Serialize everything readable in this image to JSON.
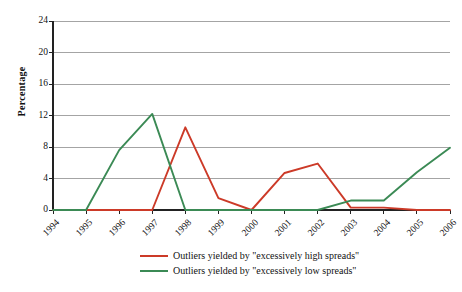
{
  "chart_data": {
    "type": "line",
    "title": "",
    "subtitle": "",
    "xlabel": "",
    "ylabel": "Percentage",
    "categories": [
      "1994",
      "1995",
      "1996",
      "1997",
      "1998",
      "1999",
      "2000",
      "2001",
      "2002",
      "2003",
      "2004",
      "2005",
      "2006"
    ],
    "x": [
      1994,
      1995,
      1996,
      1997,
      1998,
      1999,
      2000,
      2001,
      2002,
      2003,
      2004,
      2005,
      2006
    ],
    "ylim": [
      0,
      24
    ],
    "yticks": [
      0,
      4,
      8,
      12,
      16,
      20,
      24
    ],
    "ytick_labels": [
      "0",
      "4",
      "8",
      "12",
      "16",
      "20",
      "24"
    ],
    "grid": "horizontal",
    "legend_position": "bottom",
    "series": [
      {
        "name": "Outliers yielded by \"excessively high spreads\"",
        "color": "#CC3A28",
        "values": [
          0,
          0,
          0,
          0,
          10.5,
          1.5,
          0,
          4.7,
          5.9,
          0.3,
          0.3,
          0,
          0
        ]
      },
      {
        "name": "Outliers yielded by \"excessively low spreads\"",
        "color": "#3B8A55",
        "values": [
          0,
          0,
          7.6,
          12.2,
          0,
          0,
          0,
          0,
          0,
          1.2,
          1.2,
          4.8,
          7.9
        ]
      }
    ]
  },
  "axis": {
    "y_title": "Percentage",
    "y_tick_labels": [
      "0",
      "4",
      "8",
      "12",
      "16",
      "20",
      "24"
    ],
    "x_tick_labels": [
      "1994",
      "1995",
      "1996",
      "1997",
      "1998",
      "1999",
      "2000",
      "2001",
      "2002",
      "2003",
      "2004",
      "2005",
      "2006"
    ]
  },
  "legend": {
    "items": [
      {
        "label": "Outliers yielded by \"excessively high spreads\"",
        "color": "#CC3A28"
      },
      {
        "label": "Outliers yielded by \"excessively low spreads\"",
        "color": "#3B8A55"
      }
    ]
  },
  "colors": {
    "series_high": "#CC3A28",
    "series_low": "#3B8A55",
    "gridline": "#9a9a9a",
    "axis": "#222222",
    "background": "#ffffff"
  }
}
